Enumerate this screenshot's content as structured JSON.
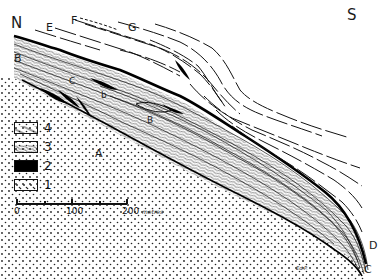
{
  "figure": {
    "type": "geological cross-section",
    "orientation": {
      "left": "N",
      "right": "S"
    },
    "point_labels": [
      {
        "id": "N",
        "text": "N"
      },
      {
        "id": "S",
        "text": "S"
      },
      {
        "id": "E",
        "text": "E"
      },
      {
        "id": "F",
        "text": "F"
      },
      {
        "id": "G",
        "text": "G"
      },
      {
        "id": "B1",
        "text": "B"
      },
      {
        "id": "C1",
        "text": "C"
      },
      {
        "id": "b",
        "text": "b"
      },
      {
        "id": "B2",
        "text": "B"
      },
      {
        "id": "A",
        "text": "A"
      },
      {
        "id": "D",
        "text": "D"
      },
      {
        "id": "C2",
        "text": "C"
      },
      {
        "id": "sig",
        "text": "Ed.P."
      }
    ]
  },
  "legend": {
    "items": [
      {
        "number": "4",
        "pattern": "diagonal-lines"
      },
      {
        "number": "3",
        "pattern": "wavy-lines"
      },
      {
        "number": "2",
        "pattern": "solid-black"
      },
      {
        "number": "1",
        "pattern": "dots"
      }
    ]
  },
  "scale_bar": {
    "labels": [
      "0",
      "100",
      "200"
    ],
    "unit": "metres"
  },
  "colors": {
    "ink": "#111111",
    "background": "#ffffff"
  }
}
